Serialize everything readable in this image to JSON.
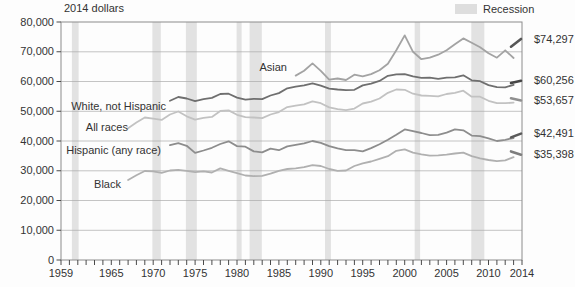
{
  "title": "2014 dollars",
  "legend": {
    "label": "Recession",
    "swatch_color": "#dedede"
  },
  "chart_data": {
    "type": "line",
    "title": "2014 dollars",
    "ylabel": "2014 dollars",
    "x_range": [
      1959,
      2014
    ],
    "y_range": [
      0,
      80000
    ],
    "y_tick_step": 10000,
    "y_tick_labels": [
      "0",
      "10,000",
      "20,000",
      "30,000",
      "40,000",
      "50,000",
      "60,000",
      "70,000",
      "80,000"
    ],
    "x_tick_labels": [
      "1959",
      "1965",
      "1970",
      "1975",
      "1980",
      "1985",
      "1990",
      "1995",
      "2000",
      "2005",
      "2010",
      "2014"
    ],
    "x_label_years": [
      1959,
      1965,
      1970,
      1975,
      1980,
      1985,
      1990,
      1995,
      2000,
      2005,
      2010,
      2014
    ],
    "grid": "horizontal",
    "band_color": "#e2e2e2",
    "grid_color": "#ababab",
    "border_color": "#8c8c8c",
    "tick_color": "#4a4a4a",
    "legend_position": "top-right",
    "recessions": [
      [
        1960.3,
        1961.1
      ],
      [
        1969.9,
        1970.9
      ],
      [
        1973.9,
        1975.2
      ],
      [
        1979.95,
        1980.55
      ],
      [
        1981.5,
        1982.95
      ],
      [
        1990.5,
        1991.2
      ],
      [
        2001.2,
        2001.85
      ],
      [
        2007.95,
        2009.5
      ]
    ],
    "series": [
      {
        "key": "asian",
        "name": "Asian",
        "color": "#a3a3a3",
        "dash_color": "#565656",
        "start_year": 1987,
        "values": [
          62000,
          63600,
          66100,
          63600,
          60600,
          61000,
          60500,
          62300,
          61700,
          62500,
          63800,
          66000,
          70500,
          75500,
          70000,
          67500,
          68000,
          69000,
          70500,
          72500,
          74500,
          73000,
          71500,
          69500,
          68000,
          70500,
          67900
        ],
        "redesign_2013_2014": [
          71700,
          74297
        ],
        "end_value": 74297,
        "end_label": "$74,297"
      },
      {
        "key": "white_not_hispanic",
        "name": "White, not Hispanic",
        "color": "#6f6f6f",
        "dash_color": "#454545",
        "start_year": 1972,
        "values": [
          53500,
          54800,
          54300,
          53400,
          54100,
          54500,
          55800,
          55900,
          54600,
          53900,
          54200,
          54100,
          55300,
          56100,
          57700,
          58300,
          58700,
          59400,
          58600,
          57600,
          57300,
          57100,
          57200,
          58700,
          59300,
          60200,
          61900,
          62400,
          62500,
          61700,
          61200,
          61300,
          60900,
          61300,
          61400,
          62100,
          60400,
          60100,
          58800,
          58100,
          58000,
          58900
        ],
        "redesign_2013_2014": [
          59500,
          60256
        ],
        "end_value": 60256,
        "end_label": "$60,256"
      },
      {
        "key": "all_races",
        "name": "All races",
        "color": "#c2c2c2",
        "dash_color": "#8f8f8f",
        "start_year": 1967,
        "values": [
          44300,
          46200,
          47900,
          47500,
          47100,
          48900,
          49900,
          48300,
          47200,
          47800,
          48100,
          50100,
          50300,
          48800,
          48000,
          47900,
          47700,
          48900,
          49700,
          51400,
          51900,
          52300,
          53300,
          52700,
          51300,
          50700,
          50400,
          50900,
          52600,
          53200,
          54300,
          56200,
          57300,
          57200,
          55900,
          55300,
          55200,
          55000,
          55800,
          56200,
          56900,
          54900,
          54900,
          53500,
          52700,
          52700,
          52900
        ],
        "redesign_2013_2014": [
          54400,
          53657
        ],
        "end_value": 53657,
        "end_label": "$53,657"
      },
      {
        "key": "hispanic",
        "name": "Hispanic (any race)",
        "color": "#8d8d8d",
        "dash_color": "#5a5a5a",
        "start_year": 1972,
        "values": [
          38600,
          39300,
          38400,
          36000,
          36800,
          37700,
          39000,
          39900,
          38300,
          38100,
          36500,
          36200,
          37400,
          36900,
          38200,
          38700,
          39200,
          40000,
          39400,
          38300,
          37500,
          36900,
          36900,
          36500,
          37600,
          38900,
          40400,
          42100,
          43900,
          43300,
          42700,
          42000,
          42100,
          42800,
          43900,
          43600,
          41800,
          41600,
          40900,
          40000,
          40400,
          41000
        ],
        "redesign_2013_2014": [
          41200,
          42491
        ],
        "end_value": 42491,
        "end_label": "$42,491"
      },
      {
        "key": "black",
        "name": "Black",
        "color": "#b0b0b0",
        "dash_color": "#7d7d7d",
        "start_year": 1967,
        "values": [
          26900,
          28500,
          29900,
          29800,
          29300,
          30100,
          30300,
          30000,
          29500,
          29800,
          29400,
          30800,
          30000,
          29200,
          28400,
          28200,
          28300,
          29000,
          30000,
          30600,
          30800,
          31200,
          31900,
          31600,
          30600,
          30000,
          30100,
          31600,
          32500,
          33100,
          34000,
          34900,
          36700,
          37200,
          36100,
          35500,
          35100,
          35200,
          35400,
          35800,
          36100,
          34900,
          34200,
          33600,
          33200,
          33500,
          34600
        ],
        "redesign_2013_2014": [
          36500,
          35398
        ],
        "end_value": 35398,
        "end_label": "$35,398"
      }
    ]
  }
}
